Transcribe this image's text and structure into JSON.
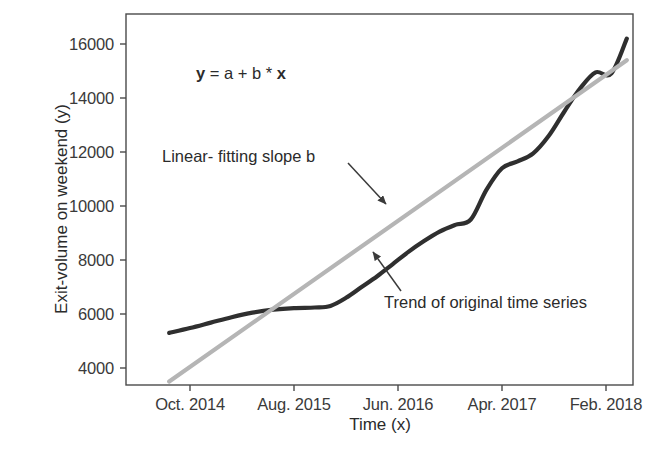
{
  "chart_data": {
    "type": "line",
    "title": "",
    "xlabel": "Time (x)",
    "ylabel": "Exit-volume on weekend (y)",
    "xlim": [
      0,
      56
    ],
    "ylim": [
      2800,
      17000
    ],
    "grid": false,
    "legend_position": "none",
    "x_tick_labels": [
      "Oct. 2014",
      "Aug. 2015",
      "Jun. 2016",
      "Apr. 2017",
      "Feb. 2018"
    ],
    "x_tick_values": [
      4,
      14,
      24,
      34,
      44
    ],
    "y_tick_labels": [
      "4000",
      "6000",
      "8000",
      "10000",
      "12000",
      "14000",
      "16000"
    ],
    "y_tick_values": [
      4000,
      6000,
      8000,
      10000,
      12000,
      14000,
      16000
    ],
    "series": [
      {
        "name": "Trend of original time series",
        "color": "#2f2f2f",
        "width": 4.2,
        "x": [
          2.0,
          4.0,
          6.0,
          8.0,
          10.0,
          12.0,
          14.0,
          16.0,
          17.5,
          19.0,
          20.5,
          22.0,
          23.5,
          25.0,
          26.5,
          28.0,
          29.5,
          31.0,
          32.5,
          34.0,
          35.5,
          37.0,
          38.5,
          40.0,
          41.5,
          43.0,
          44.5,
          46.0
        ],
        "y": [
          5300,
          5480,
          5680,
          5880,
          6050,
          6160,
          6220,
          6240,
          6300,
          6600,
          7000,
          7400,
          7850,
          8300,
          8700,
          9050,
          9300,
          9500,
          10600,
          11400,
          11650,
          11950,
          12600,
          13500,
          14350,
          14950,
          14900,
          16200
        ]
      },
      {
        "name": "Linear- fitting slope b",
        "color": "#b5b5b5",
        "width": 4.2,
        "x": [
          2.0,
          46.0
        ],
        "y": [
          3500,
          15400
        ]
      }
    ],
    "annotations": [
      {
        "name": "equation",
        "text_parts": [
          {
            "text": "y",
            "bold": true
          },
          {
            "text": " = a + b * ",
            "bold": false
          },
          {
            "text": "x",
            "bold": true
          }
        ],
        "plain_text": "y = a + b * x"
      },
      {
        "name": "slope-label",
        "text": "Linear- fitting slope b",
        "arrow_from": [
          348,
          163
        ],
        "arrow_to": [
          386,
          204
        ]
      },
      {
        "name": "trend-label",
        "text": "Trend of original time series",
        "arrow_from": [
          401,
          291
        ],
        "arrow_to": [
          373,
          252
        ]
      }
    ],
    "frame": {
      "left": 126,
      "top": 14,
      "right": 633,
      "bottom": 385,
      "color": "#4a4a4a"
    }
  }
}
